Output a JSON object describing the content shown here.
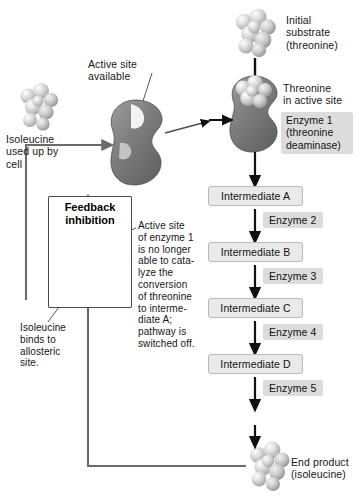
{
  "diagram": {
    "colors": {
      "box_fill": "#e9e9e9",
      "box_border": "#b9b9b9",
      "enzyme_tag_fill": "#dcdcdc",
      "enzyme_body": "#7b7b7b",
      "molecule": "#d4d4d4",
      "arrow": "#111111",
      "feedback_line": "#6b6b6b",
      "panel_border": "#4a4a4a"
    }
  },
  "labels": {
    "initial_substrate": "Initial\nsubstrate\n(threonine)",
    "threonine_in_active_site": "Threonine\nin active site",
    "enzyme1": "Enzyme 1\n(threonine\ndeaminase)",
    "active_site_available": "Active site\navailable",
    "isoleucine_used_up": "Isoleucine\nused up by\ncell",
    "feedback_inhibition": "Feedback\ninhibition",
    "active_site_blocked": "Active site\nof enzyme 1\nis no longer\nable to cata-\nlyze the\nconversion\nof threonine\nto interme-\ndiate A;\npathway is\nswitched off.",
    "isoleucine_binds": "Isoleucine\nbinds to\nallosteric\nsite.",
    "end_product": "End product\n(isoleucine)"
  },
  "pathway": {
    "steps": [
      {
        "enzyme": "Enzyme 1 (threonine deaminase)",
        "product": "Intermediate A"
      },
      {
        "enzyme": "Enzyme 2",
        "product": "Intermediate B"
      },
      {
        "enzyme": "Enzyme 3",
        "product": "Intermediate C"
      },
      {
        "enzyme": "Enzyme 4",
        "product": "Intermediate D"
      },
      {
        "enzyme": "Enzyme 5",
        "product": "End product (isoleucine)"
      }
    ],
    "intermediates": [
      "Intermediate A",
      "Intermediate B",
      "Intermediate C",
      "Intermediate D"
    ],
    "enzyme_tags": [
      "Enzyme 2",
      "Enzyme 3",
      "Enzyme 4",
      "Enzyme 5"
    ]
  }
}
